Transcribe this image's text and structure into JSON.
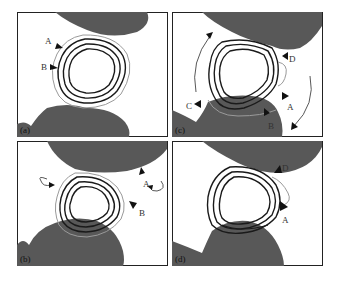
{
  "figure": {
    "panels": [
      {
        "id": "a",
        "label": "(a)",
        "markers": [
          "A",
          "B"
        ]
      },
      {
        "id": "c",
        "label": "(c)",
        "markers": [
          "D",
          "A",
          "B",
          "C"
        ]
      },
      {
        "id": "b",
        "label": "(b)",
        "markers": [
          "A",
          "B"
        ]
      },
      {
        "id": "d",
        "label": "(d)",
        "markers": [
          "D",
          "A"
        ]
      }
    ],
    "colors": {
      "grain": "#585858",
      "contour_dark": "#1a1a1a",
      "contour_light": "#9a9a9a",
      "border": "#222222",
      "background": "#ffffff"
    }
  },
  "panel_a": {
    "label": "(a)",
    "marker_a": "A",
    "marker_b": "B"
  },
  "panel_b": {
    "label": "(b)",
    "marker_a": "A",
    "marker_b": "B"
  },
  "panel_c": {
    "label": "(c)",
    "marker_a": "A",
    "marker_b": "B",
    "marker_c": "C",
    "marker_d": "D"
  },
  "panel_d": {
    "label": "(d)",
    "marker_a": "A",
    "marker_d": "D"
  }
}
